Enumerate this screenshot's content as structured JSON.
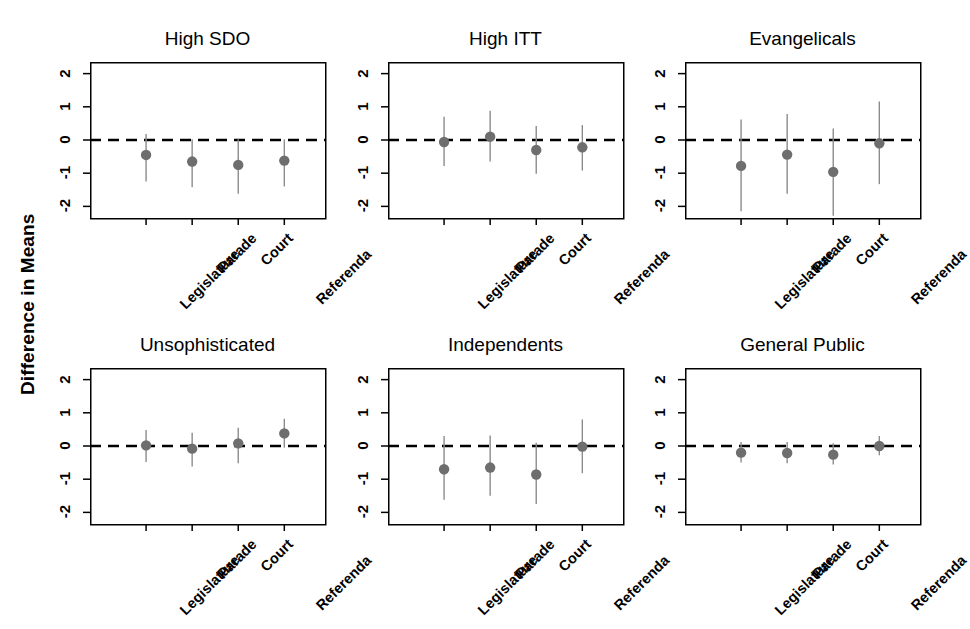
{
  "figure": {
    "ylabel": "Difference in Means",
    "accent_point_color": "#6e6e6e",
    "errorbar_color": "#8c8c8c",
    "zero_line_color": "#000000",
    "axis_color": "#000000"
  },
  "axis": {
    "y_ticks": [
      "2",
      "1",
      "0",
      "-1",
      "-2"
    ],
    "y_tick_values": [
      2,
      1,
      0,
      -1,
      -2
    ],
    "x_ticks": [
      "Legislature",
      "Parade",
      "Court",
      "Referenda"
    ]
  },
  "chart_data": {
    "type": "scatter",
    "title": "",
    "subtitle": "",
    "xlabel": "",
    "ylabel": "Difference in Means",
    "ylim": [
      -2.35,
      2.35
    ],
    "grid": false,
    "legend": "none",
    "reference_line": {
      "y": 0,
      "style": "dashed"
    },
    "categories": [
      "Legislature",
      "Parade",
      "Court",
      "Referenda"
    ],
    "panels": [
      {
        "title": "High SDO",
        "row": 0,
        "col": 0,
        "values": [
          -0.45,
          -0.65,
          -0.75,
          -0.62
        ],
        "ci_low": [
          -1.25,
          -1.42,
          -1.62,
          -1.4
        ],
        "ci_high": [
          0.18,
          0.02,
          0.02,
          0.02
        ]
      },
      {
        "title": "High ITT",
        "row": 0,
        "col": 1,
        "values": [
          -0.06,
          0.1,
          -0.3,
          -0.22
        ],
        "ci_low": [
          -0.78,
          -0.65,
          -1.02,
          -0.92
        ],
        "ci_high": [
          0.7,
          0.88,
          0.42,
          0.45
        ]
      },
      {
        "title": "Evangelicals",
        "row": 0,
        "col": 2,
        "values": [
          -0.78,
          -0.44,
          -0.96,
          -0.1
        ],
        "ci_low": [
          -2.15,
          -1.62,
          -2.28,
          -1.33
        ],
        "ci_high": [
          0.62,
          0.78,
          0.35,
          1.16
        ]
      },
      {
        "title": "Unsophisticated",
        "row": 1,
        "col": 0,
        "values": [
          0.02,
          -0.08,
          0.08,
          0.38
        ],
        "ci_low": [
          -0.48,
          -0.62,
          -0.52,
          -0.05
        ],
        "ci_high": [
          0.48,
          0.4,
          0.55,
          0.82
        ]
      },
      {
        "title": "Independents",
        "row": 1,
        "col": 1,
        "values": [
          -0.7,
          -0.65,
          -0.86,
          -0.02
        ],
        "ci_low": [
          -1.62,
          -1.5,
          -1.75,
          -0.82
        ],
        "ci_high": [
          0.3,
          0.32,
          0.1,
          0.8
        ]
      },
      {
        "title": "General Public",
        "row": 1,
        "col": 2,
        "values": [
          -0.2,
          -0.21,
          -0.26,
          0.0
        ],
        "ci_low": [
          -0.5,
          -0.52,
          -0.56,
          -0.28
        ],
        "ci_high": [
          0.12,
          0.12,
          0.08,
          0.3
        ]
      }
    ]
  }
}
